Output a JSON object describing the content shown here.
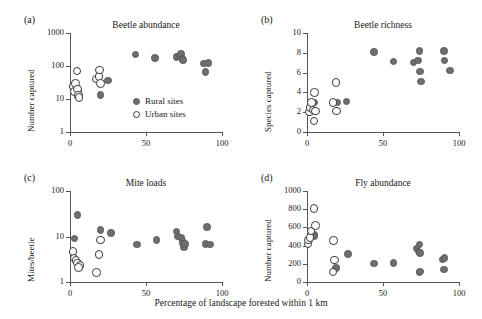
{
  "figure": {
    "xlabel": "Percentage of landscape forested within 1 km",
    "legend": {
      "rural": {
        "label": "Rural sites",
        "color": "#6e6e6e",
        "marker": "filled-circle"
      },
      "urban": {
        "label": "Urban sites",
        "color": "#ffffff",
        "marker": "open-circle"
      }
    },
    "marker_colors": {
      "rural_fill": "#6e6e6e",
      "urban_fill": "#ffffff",
      "urban_stroke": "#3a3a3a",
      "axis": "#555555",
      "text": "#1a1a1a"
    }
  },
  "chart_data": [
    {
      "panel": "a",
      "type": "scatter",
      "title": "Beetle abundance",
      "xlabel": "Percentage of landscape forested within 1 km",
      "ylabel": "Number captured",
      "yscale": "log",
      "ylim": [
        1,
        1000
      ],
      "yticks": [
        1,
        10,
        100,
        1000
      ],
      "ytick_labels": [
        "1",
        "10",
        "100",
        "1000"
      ],
      "xlim": [
        0,
        100
      ],
      "xticks": [
        0,
        50,
        100
      ],
      "xtick_labels": [
        "0",
        "50",
        "100"
      ],
      "grid": false,
      "legend_position": "lower-right-inside",
      "series": [
        {
          "name": "Urban sites",
          "marker": "open-circle",
          "points": [
            [
              2.0,
              24
            ],
            [
              3.0,
              17
            ],
            [
              3.5,
              30
            ],
            [
              4.5,
              70
            ],
            [
              5.0,
              20
            ],
            [
              5.5,
              13
            ],
            [
              6.0,
              11
            ],
            [
              17.0,
              40
            ],
            [
              19.0,
              48
            ],
            [
              19.5,
              75
            ],
            [
              20.0,
              30
            ]
          ]
        },
        {
          "name": "Rural sites",
          "marker": "filled-circle",
          "points": [
            [
              4.0,
              16
            ],
            [
              5.0,
              12
            ],
            [
              5.5,
              18
            ],
            [
              6.0,
              11
            ],
            [
              20.0,
              13
            ],
            [
              25.0,
              36
            ],
            [
              43.0,
              225
            ],
            [
              56.0,
              175
            ],
            [
              70.0,
              185
            ],
            [
              72.0,
              200
            ],
            [
              73.0,
              230
            ],
            [
              74.0,
              170
            ],
            [
              74.5,
              150
            ],
            [
              88.0,
              120
            ],
            [
              89.0,
              65
            ],
            [
              91.0,
              125
            ]
          ]
        }
      ]
    },
    {
      "panel": "b",
      "type": "scatter",
      "title": "Beetle richness",
      "xlabel": "Percentage of landscape forested within 1 km",
      "ylabel": "Species captured",
      "yscale": "linear",
      "ylim": [
        0,
        10
      ],
      "yticks": [
        0,
        2,
        4,
        6,
        8,
        10
      ],
      "ytick_labels": [
        "0",
        "2",
        "4",
        "6",
        "8",
        "10"
      ],
      "xlim": [
        0,
        100
      ],
      "xticks": [
        0,
        50,
        100
      ],
      "xtick_labels": [
        "0",
        "50",
        "100"
      ],
      "grid": false,
      "legend_position": "none",
      "series": [
        {
          "name": "Urban sites",
          "marker": "open-circle",
          "points": [
            [
              1.5,
              2.0
            ],
            [
              2.0,
              2.5
            ],
            [
              3.0,
              3.0
            ],
            [
              4.0,
              2.2
            ],
            [
              5.0,
              4.0
            ],
            [
              5.5,
              2.1
            ],
            [
              4.5,
              1.1
            ],
            [
              17.0,
              3.0
            ],
            [
              19.0,
              5.0
            ],
            [
              19.5,
              2.1
            ]
          ]
        },
        {
          "name": "Rural sites",
          "marker": "filled-circle",
          "points": [
            [
              3.0,
              2.2
            ],
            [
              5.0,
              3.0
            ],
            [
              20.0,
              3.0
            ],
            [
              26.0,
              3.1
            ],
            [
              44.0,
              8.1
            ],
            [
              57.0,
              7.1
            ],
            [
              70.0,
              7.0
            ],
            [
              73.0,
              7.2
            ],
            [
              74.0,
              8.2
            ],
            [
              74.5,
              6.1
            ],
            [
              75.0,
              5.1
            ],
            [
              90.0,
              8.2
            ],
            [
              90.5,
              7.2
            ],
            [
              94.0,
              6.2
            ]
          ]
        }
      ]
    },
    {
      "panel": "c",
      "type": "scatter",
      "title": "Mite loads",
      "xlabel": "Percentage of landscape forested within 1 km",
      "ylabel": "Mites/beetle",
      "yscale": "log",
      "ylim": [
        1,
        100
      ],
      "yticks": [
        1,
        10,
        100
      ],
      "ytick_labels": [
        "1",
        "10",
        "100"
      ],
      "xlim": [
        0,
        100
      ],
      "xticks": [
        0,
        50,
        100
      ],
      "xtick_labels": [
        "0",
        "50",
        "100"
      ],
      "grid": false,
      "legend_position": "none",
      "series": [
        {
          "name": "Urban sites",
          "marker": "open-circle",
          "points": [
            [
              2.0,
              4.7
            ],
            [
              2.5,
              3.4
            ],
            [
              4.0,
              3.0
            ],
            [
              5.0,
              2.6
            ],
            [
              6.5,
              2.3
            ],
            [
              5.5,
              2.1
            ],
            [
              17.5,
              1.6
            ],
            [
              19.0,
              4.0
            ],
            [
              20.0,
              8.3
            ]
          ]
        },
        {
          "name": "Rural sites",
          "marker": "filled-circle",
          "points": [
            [
              3.0,
              9.0
            ],
            [
              5.0,
              30
            ],
            [
              20.0,
              14
            ],
            [
              27.0,
              12
            ],
            [
              44.0,
              6.6
            ],
            [
              57.0,
              8.3
            ],
            [
              70.0,
              13
            ],
            [
              71.0,
              10
            ],
            [
              73.0,
              9.5
            ],
            [
              74.0,
              8.2
            ],
            [
              74.5,
              7.0
            ],
            [
              75.0,
              5.8
            ],
            [
              75.5,
              6.8
            ],
            [
              89.0,
              6.8
            ],
            [
              90.0,
              16
            ],
            [
              92.0,
              6.6
            ]
          ]
        }
      ]
    },
    {
      "panel": "d",
      "type": "scatter",
      "title": "Fly abundance",
      "xlabel": "Percentage of landscape forested within 1 km",
      "ylabel": "Number captured",
      "yscale": "linear",
      "ylim": [
        0,
        1000
      ],
      "yticks": [
        0,
        200,
        400,
        600,
        800,
        1000
      ],
      "ytick_labels": [
        "0",
        "200",
        "400",
        "600",
        "800",
        "1000"
      ],
      "xlim": [
        0,
        100
      ],
      "xticks": [
        0,
        50,
        100
      ],
      "xtick_labels": [
        "0",
        "50",
        "100"
      ],
      "grid": false,
      "legend_position": "none",
      "series": [
        {
          "name": "Urban sites",
          "marker": "open-circle",
          "points": [
            [
              0.5,
              420
            ],
            [
              1.0,
              460
            ],
            [
              2.0,
              490
            ],
            [
              2.5,
              560
            ],
            [
              4.5,
              805
            ],
            [
              5.5,
              620
            ],
            [
              17.5,
              455
            ],
            [
              18.0,
              240
            ],
            [
              17.0,
              110
            ]
          ]
        },
        {
          "name": "Rural sites",
          "marker": "filled-circle",
          "points": [
            [
              4.5,
              520
            ],
            [
              5.0,
              500
            ],
            [
              19.0,
              155
            ],
            [
              27.0,
              310
            ],
            [
              44.0,
              205
            ],
            [
              57.0,
              207
            ],
            [
              72.0,
              370
            ],
            [
              73.5,
              335
            ],
            [
              74.0,
              410
            ],
            [
              74.5,
              320
            ],
            [
              74.0,
              105
            ],
            [
              74.5,
              115
            ],
            [
              89.0,
              245
            ],
            [
              90.5,
              265
            ],
            [
              90.0,
              135
            ]
          ]
        }
      ]
    }
  ]
}
